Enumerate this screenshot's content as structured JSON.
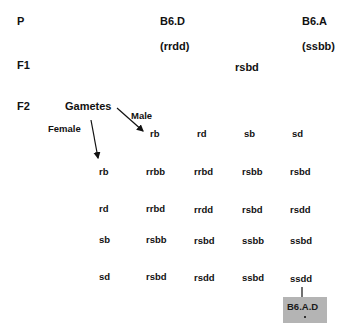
{
  "generations": {
    "p": {
      "label": "P",
      "parent1": {
        "strain": "B6.D",
        "genotype": "(rrdd)"
      },
      "parent2": {
        "strain": "B6.A",
        "genotype": "(ssbb)"
      }
    },
    "f1": {
      "label": "F1",
      "genotype": "rsbd"
    },
    "f2": {
      "label": "F2"
    }
  },
  "punnett": {
    "gametes_label": "Gametes",
    "male_label": "Male",
    "female_label": "Female",
    "male_gametes": [
      "rb",
      "rd",
      "sb",
      "sd"
    ],
    "female_gametes": [
      "rb",
      "rd",
      "sb",
      "sd"
    ],
    "rows": [
      [
        "rrbb",
        "rrbd",
        "rsbb",
        "rsbd"
      ],
      [
        "rrbd",
        "rrdd",
        "rsbd",
        "rsdd"
      ],
      [
        "rsbb",
        "rsbd",
        "ssbb",
        "ssbd"
      ],
      [
        "rsbd",
        "rsdd",
        "ssbd",
        "ssdd"
      ]
    ]
  },
  "result": {
    "label": "B6.A.D",
    "box_color": "#b4b4b4",
    "from_genotype": "ssdd"
  }
}
